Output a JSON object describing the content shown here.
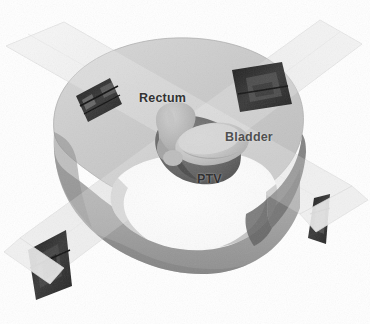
{
  "image": {
    "kind": "3d-radiotherapy-treatment-plan-render",
    "width": 370,
    "height": 324,
    "background_color": "#ffffff",
    "description": "Grayscale three-dimensional rendering of a patient pelvis slab with four intersecting radiation beams and labelled internal structures."
  },
  "labels": {
    "rectum": "Rectum",
    "bladder": "Bladder",
    "ptv": "PTV"
  },
  "label_colors": {
    "rectum": "#2b2b2b",
    "bladder": "#4a4a4a",
    "ptv": "#2b2b2b"
  },
  "palette": {
    "background": "#ffffff",
    "body_top": "#c9c9c9",
    "body_top_light": "#d6d6d6",
    "body_side": "#a8a8a8",
    "body_side_dark": "#8e8e8e",
    "body_rim_dark": "#6f6f6f",
    "cavity_white": "#fbfbfb",
    "cavity_shade": "#efefef",
    "beam_band": "#ededed",
    "beam_band_edge": "#dcdcdc",
    "aperture_dark": "#2a2a2a",
    "aperture_mid": "#4f4f4f",
    "bladder_fill": "#c2c2c2",
    "bladder_highlight": "#d4d4d4",
    "rectum_fill": "#b5b5b5",
    "ptv_fill": "#6a6a6a",
    "ptv_dark": "#4e4e4e"
  },
  "structures": [
    {
      "name": "body",
      "label": "Patient body contour",
      "shade": "#c9c9c9"
    },
    {
      "name": "ptv",
      "label": "PTV",
      "shade": "#6a6a6a"
    },
    {
      "name": "bladder",
      "label": "Bladder",
      "shade": "#c2c2c2"
    },
    {
      "name": "rectum",
      "label": "Rectum",
      "shade": "#b5b5b5"
    }
  ],
  "beams": [
    {
      "name": "beam-upper-left",
      "direction": "from upper-left",
      "aperture": "mlc-aperture-upper-left"
    },
    {
      "name": "beam-upper-right",
      "direction": "from upper-right",
      "aperture": "mlc-aperture-upper-right"
    },
    {
      "name": "beam-lower-left",
      "direction": "to lower-left",
      "aperture": "mlc-aperture-lower-left"
    },
    {
      "name": "beam-lower-right",
      "direction": "to lower-right",
      "aperture": "mlc-aperture-lower-right"
    }
  ]
}
